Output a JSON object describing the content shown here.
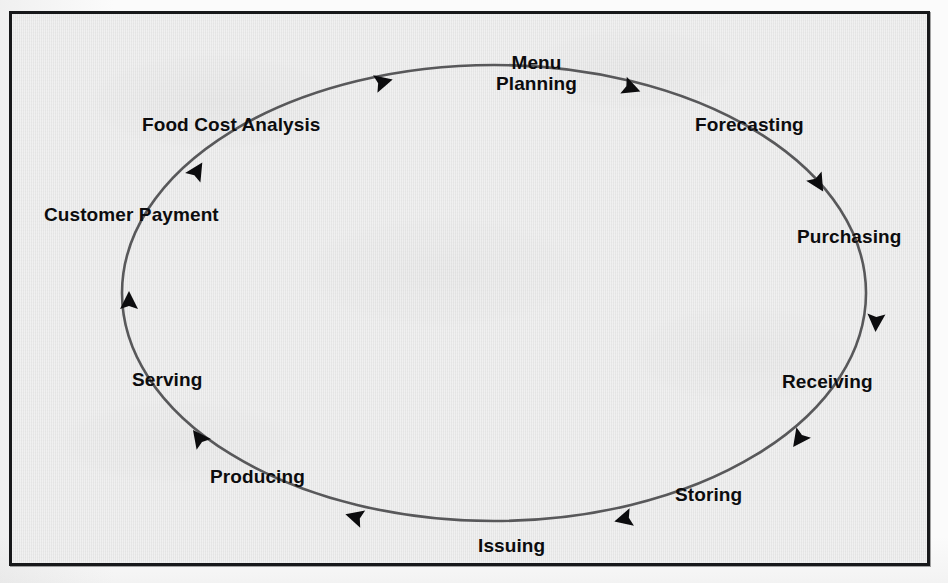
{
  "figure": {
    "frame_color": "#17181a",
    "background_color": "#e9e9e9",
    "line_color": "#58585a",
    "text_color": "#0c0c0e",
    "flow_direction": "clockwise"
  },
  "chart_data": {
    "type": "diagram",
    "diagram_kind": "cycle",
    "title": "",
    "direction": "clockwise",
    "ellipse": {
      "center_x": 482,
      "center_y": 279,
      "radius_x": 372,
      "radius_y": 228
    },
    "stages": [
      {
        "index": 1,
        "label": "Menu\nPlanning",
        "label_line_1": "Menu",
        "label_line_2": "Planning",
        "angle_deg": 278,
        "label_x": 484,
        "label_y": 38,
        "lines": 2
      },
      {
        "index": 2,
        "label": "Forecasting",
        "angle_deg": 320,
        "label_x": 683,
        "label_y": 100,
        "lines": 1
      },
      {
        "index": 3,
        "label": "Purchasing",
        "angle_deg": 352,
        "label_x": 785,
        "label_y": 212,
        "lines": 1
      },
      {
        "index": 4,
        "label": "Receiving",
        "angle_deg": 28,
        "label_x": 770,
        "label_y": 357,
        "lines": 1
      },
      {
        "index": 5,
        "label": "Storing",
        "angle_deg": 60,
        "label_x": 663,
        "label_y": 470,
        "lines": 1
      },
      {
        "index": 6,
        "label": "Issuing",
        "angle_deg": 92,
        "label_x": 466,
        "label_y": 521,
        "lines": 1
      },
      {
        "index": 7,
        "label": "Producing",
        "angle_deg": 126,
        "label_x": 198,
        "label_y": 452,
        "lines": 1
      },
      {
        "index": 8,
        "label": "Serving",
        "angle_deg": 158,
        "label_x": 120,
        "label_y": 355,
        "lines": 1
      },
      {
        "index": 9,
        "label": "Customer Payment",
        "angle_deg": 196,
        "label_x": 32,
        "label_y": 190,
        "lines": 1
      },
      {
        "index": 10,
        "label": "Food Cost Analysis",
        "angle_deg": 238,
        "label_x": 130,
        "label_y": 100,
        "lines": 1
      }
    ],
    "arrowheads": [
      {
        "index": 1,
        "on_segment": "Food Cost Analysis to Menu Planning",
        "x": 371,
        "y": 68,
        "rotation_deg": -14
      },
      {
        "index": 2,
        "on_segment": "Menu Planning to Forecasting",
        "x": 619,
        "y": 74,
        "rotation_deg": 21
      },
      {
        "index": 3,
        "on_segment": "Forecasting to Purchasing",
        "x": 806,
        "y": 169,
        "rotation_deg": 59
      },
      {
        "index": 4,
        "on_segment": "Purchasing to Receiving",
        "x": 864,
        "y": 308,
        "rotation_deg": 93
      },
      {
        "index": 5,
        "on_segment": "Receiving to Storing",
        "x": 787,
        "y": 425,
        "rotation_deg": 126
      },
      {
        "index": 6,
        "on_segment": "Storing to Issuing",
        "x": 612,
        "y": 505,
        "rotation_deg": 166
      },
      {
        "index": 7,
        "on_segment": "Issuing to Producing",
        "x": 343,
        "y": 503,
        "rotation_deg": 196
      },
      {
        "index": 8,
        "on_segment": "Producing to Serving",
        "x": 187,
        "y": 424,
        "rotation_deg": 233
      },
      {
        "index": 9,
        "on_segment": "Serving to Customer Payment",
        "x": 117,
        "y": 287,
        "rotation_deg": 270
      },
      {
        "index": 10,
        "on_segment": "Customer Payment to Food Cost Analysis",
        "x": 185,
        "y": 157,
        "rotation_deg": 302
      }
    ]
  }
}
